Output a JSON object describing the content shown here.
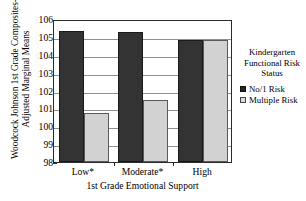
{
  "chart_data": {
    "type": "bar",
    "title": "",
    "xlabel": "1st Grade Emotional Support",
    "ylabel_line1": "Woodcock Johnson 1st Grade Composites-",
    "ylabel_line2": "Adjusted Marginal Means",
    "categories": [
      "Low*",
      "Moderate*",
      "High"
    ],
    "series": [
      {
        "name": "No/1 Risk",
        "color": "#333333",
        "values": [
          105.35,
          105.3,
          104.85
        ]
      },
      {
        "name": "Multiple Risk",
        "color": "#d2d2d2",
        "values": [
          100.75,
          101.45,
          104.8
        ]
      }
    ],
    "ylim": [
      98,
      106
    ],
    "yticks": [
      98,
      99,
      100,
      101,
      102,
      103,
      104,
      105,
      106
    ],
    "ytick_labels": [
      "98",
      "99",
      "100",
      "101",
      "102",
      "103",
      "104",
      "105",
      "106"
    ],
    "grid": true,
    "legend_position": "right"
  },
  "legend": {
    "title_line1": "Kindergarten",
    "title_line2": "Functional Risk",
    "title_line3": "Status",
    "items": [
      {
        "label": "No/1 Risk",
        "swatch": "dark-square-icon"
      },
      {
        "label": "Multiple Risk",
        "swatch": "light-square-icon"
      }
    ]
  }
}
